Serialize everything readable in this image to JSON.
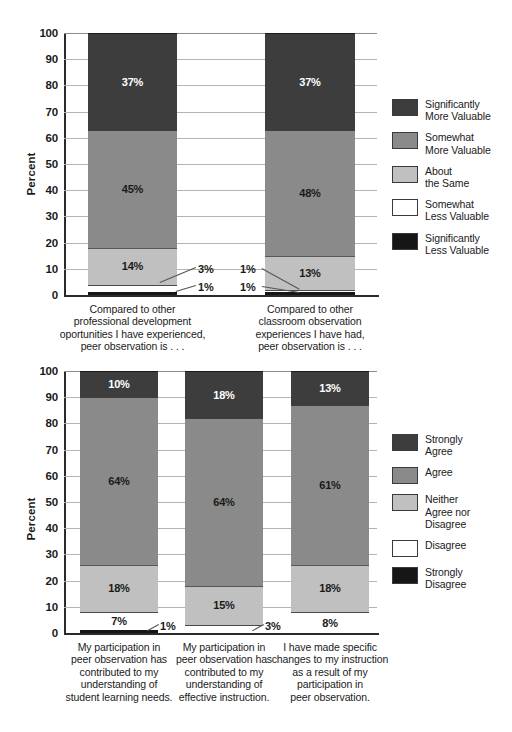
{
  "chart_data": [
    {
      "id": "value-comparison",
      "type": "bar",
      "subtype": "stacked-100-percent",
      "title": "",
      "xlabel": "",
      "ylabel": "Percent",
      "ylim": [
        0,
        100
      ],
      "ytick_labels": [
        "0",
        "10",
        "20",
        "30",
        "40",
        "50",
        "60",
        "70",
        "80",
        "90",
        "100"
      ],
      "ytick_values": [
        0,
        10,
        20,
        30,
        40,
        50,
        60,
        70,
        80,
        90,
        100
      ],
      "grid": true,
      "legend_position": "right",
      "categories": [
        "Compared to other\nprofessional development\noportunities I have experienced,\npeer observation is . . .",
        "Compared to other\nclassroom observation\nexperiences I have had,\npeer observation is . . ."
      ],
      "series": [
        {
          "name": "Significantly\nLess Valuable",
          "color": "#161616",
          "values": [
            1,
            1
          ],
          "label_color": "light"
        },
        {
          "name": "Somewhat\nLess Valuable",
          "color": "#ffffff",
          "values": [
            3,
            1
          ],
          "label_color": "dark"
        },
        {
          "name": "About\nthe Same",
          "color": "#c0c0c0",
          "values": [
            14,
            13
          ],
          "label_color": "dark"
        },
        {
          "name": "Somewhat\nMore Valuable",
          "color": "#8a8a8a",
          "values": [
            45,
            48
          ],
          "label_color": "dark"
        },
        {
          "name": "Significantly\nMore Valuable",
          "color": "#3d3d3d",
          "values": [
            37,
            37
          ],
          "label_color": "light"
        }
      ],
      "legend_order": [
        "Significantly\nMore Valuable",
        "Somewhat\nMore Valuable",
        "About\nthe Same",
        "Somewhat\nLess Valuable",
        "Significantly\nLess Valuable"
      ],
      "callouts": [
        {
          "text": "3%",
          "bar": 0,
          "series": "Somewhat Less Valuable",
          "value": 3
        },
        {
          "text": "1%",
          "bar": 0,
          "series": "Significantly Less Valuable",
          "value": 1
        },
        {
          "text": "1%",
          "bar": 1,
          "series": "Somewhat Less Valuable",
          "value": 1
        },
        {
          "text": "1%",
          "bar": 1,
          "series": "Significantly Less Valuable",
          "value": 1
        }
      ]
    },
    {
      "id": "agreement",
      "type": "bar",
      "subtype": "stacked-100-percent",
      "title": "",
      "xlabel": "",
      "ylabel": "Percent",
      "ylim": [
        0,
        100
      ],
      "ytick_labels": [
        "0",
        "10",
        "20",
        "30",
        "40",
        "50",
        "60",
        "70",
        "80",
        "90",
        "100"
      ],
      "ytick_values": [
        0,
        10,
        20,
        30,
        40,
        50,
        60,
        70,
        80,
        90,
        100
      ],
      "grid": true,
      "legend_position": "right",
      "categories": [
        "My participation in\npeer observation has\ncontributed to my\nunderstanding of\nstudent learning needs.",
        "My participation in\npeer observation has\ncontributed to my\nunderstanding of\neffective instruction.",
        "I have made specific\nchanges to my instruction\nas a result of my\nparticipation in\npeer observation."
      ],
      "series": [
        {
          "name": "Strongly\nDisagree",
          "color": "#161616",
          "values": [
            1,
            0,
            0
          ],
          "label_color": "light"
        },
        {
          "name": "Disagree",
          "color": "#ffffff",
          "values": [
            7,
            3,
            8
          ],
          "label_color": "dark"
        },
        {
          "name": "Neither\nAgree nor\nDisagree",
          "color": "#c0c0c0",
          "values": [
            18,
            15,
            18
          ],
          "label_color": "dark"
        },
        {
          "name": "Agree",
          "color": "#8a8a8a",
          "values": [
            64,
            64,
            61
          ],
          "label_color": "dark"
        },
        {
          "name": "Strongly\nAgree",
          "color": "#3d3d3d",
          "values": [
            10,
            18,
            13
          ],
          "label_color": "light"
        }
      ],
      "legend_order": [
        "Strongly\nAgree",
        "Agree",
        "Neither\nAgree nor\nDisagree",
        "Disagree",
        "Strongly\nDisagree"
      ],
      "callouts": [
        {
          "text": "1%",
          "bar": 0,
          "series": "Strongly Disagree",
          "value": 1
        },
        {
          "text": "3%",
          "bar": 1,
          "series": "Disagree",
          "value": 3
        }
      ]
    }
  ]
}
